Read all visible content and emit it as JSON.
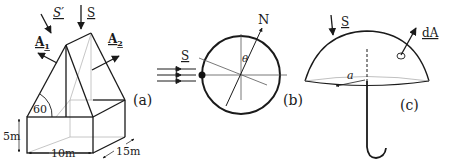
{
  "figure": {
    "panels": [
      {
        "id": "a",
        "caption": "(a)",
        "labels": {
          "sun_vector_prime": "S′",
          "sun_vector": "S",
          "area_1": "A",
          "area_1_sub": "1",
          "area_2": "A",
          "area_2_sub": "2",
          "angle": "60",
          "height": "5m",
          "width": "10m",
          "depth": "15m"
        }
      },
      {
        "id": "b",
        "caption": "(b)",
        "labels": {
          "sun_vector": "S",
          "north": "N",
          "angle": "θ"
        }
      },
      {
        "id": "c",
        "caption": "(c)",
        "labels": {
          "sun_vector": "S",
          "area_element": "dA",
          "radius": "a"
        }
      }
    ],
    "colors": {
      "ink": "#1a1a1a",
      "hidden_line": "#b0b0b0",
      "background": "#ffffff"
    }
  }
}
